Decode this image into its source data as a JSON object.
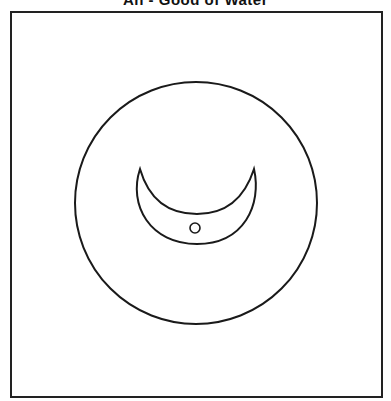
{
  "title": "Ah - Good of Water",
  "figure": {
    "stroke_color": "#1a1a1a",
    "background": "#ffffff",
    "outer_circle": {
      "cx": 196,
      "cy": 203,
      "r": 121
    },
    "crescent": {
      "left_tip": [
        140,
        169
      ],
      "right_tip": [
        254,
        169
      ],
      "outer_bottom_y": 244,
      "inner_bottom_y": 214
    },
    "dot": {
      "cx": 195,
      "cy": 228,
      "r": 5
    }
  }
}
